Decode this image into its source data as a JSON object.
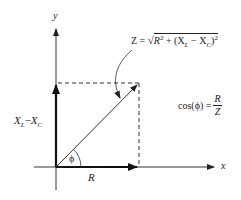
{
  "diagram": {
    "type": "impedance-phasor-diagram",
    "axes": {
      "x_label": "x",
      "y_label": "y"
    },
    "vectors": [
      {
        "name": "R",
        "label": "R",
        "direction": "horizontal"
      },
      {
        "name": "XL-XC",
        "label_main": "X",
        "sub_L": "L",
        "minus": "−",
        "label_main2": "X",
        "sub_C": "C",
        "direction": "vertical"
      },
      {
        "name": "Z",
        "direction": "diagonal"
      }
    ],
    "angle_label": "ϕ",
    "z_formula": {
      "lhs": "Z = ",
      "r": "R",
      "sq": "2",
      "plus": " + (X",
      "sub_L": "L",
      "minus": " − X",
      "sub_C": "C",
      "close": ")",
      "sq2": "2"
    },
    "cos_formula": {
      "lhs": "cos(ϕ) = ",
      "num": "R",
      "den": "Z"
    },
    "colors": {
      "line": "#222222",
      "dashed": "#333333"
    }
  }
}
